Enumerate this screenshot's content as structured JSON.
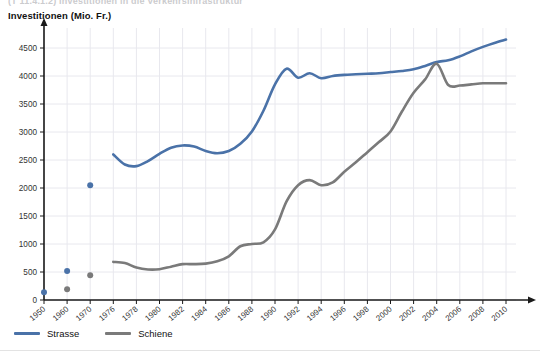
{
  "header": {
    "cut_title": "(T 11.4.1.2)   Investitionen in die Verkehrsinfrastruktur",
    "axis_title": "Investitionen (Mio. Fr.)"
  },
  "legend": {
    "position": "bottom-left",
    "items": [
      {
        "label": "Strasse",
        "color": "#4a72a8",
        "name": "legend-strasse"
      },
      {
        "label": "Schiene",
        "color": "#7a7a7a",
        "name": "legend-schiene"
      }
    ]
  },
  "colors": {
    "strasse": "#4a72a8",
    "schiene": "#7a7a7a",
    "grid": "#e8e8ee",
    "axis": "#1a1a1a",
    "text": "#333333"
  },
  "chart_data": {
    "type": "line",
    "title": "Investitionen in die Verkehrsinfrastruktur",
    "subtitle": "",
    "xlabel": "",
    "ylabel": "Investitionen (Mio. Fr.)",
    "ylim": [
      0,
      4750
    ],
    "yticks": [
      0,
      500,
      1000,
      1500,
      2000,
      2500,
      3000,
      3500,
      4000,
      4500
    ],
    "xticks": [
      "1950",
      "1960",
      "1970",
      "1976",
      "1978",
      "1980",
      "1982",
      "1984",
      "1986",
      "1988",
      "1990",
      "1992",
      "1994",
      "1996",
      "1998",
      "2000",
      "2002",
      "2004",
      "2006",
      "2008",
      "2010"
    ],
    "grid": true,
    "legend_position": "bottom-left",
    "series": [
      {
        "name": "Strasse",
        "color": "#4a72a8",
        "style": "line",
        "x": [
          1976,
          1977,
          1978,
          1979,
          1980,
          1981,
          1982,
          1983,
          1984,
          1985,
          1986,
          1987,
          1988,
          1989,
          1990,
          1991,
          1992,
          1993,
          1994,
          1995,
          1996,
          1997,
          1998,
          1999,
          2000,
          2001,
          2002,
          2003,
          2004,
          2005,
          2006,
          2007,
          2008,
          2009,
          2010
        ],
        "values": [
          2600,
          2420,
          2390,
          2480,
          2610,
          2720,
          2760,
          2740,
          2660,
          2620,
          2660,
          2790,
          3010,
          3380,
          3850,
          4130,
          3970,
          4050,
          3960,
          4000,
          4020,
          4030,
          4040,
          4050,
          4070,
          4090,
          4120,
          4180,
          4250,
          4280,
          4350,
          4440,
          4520,
          4590,
          4650
        ]
      },
      {
        "name": "Strasse (Einzelwerte)",
        "color": "#4a72a8",
        "style": "points",
        "x": [
          1950,
          1960,
          1970
        ],
        "values": [
          140,
          520,
          2050
        ]
      },
      {
        "name": "Schiene",
        "color": "#7a7a7a",
        "style": "line",
        "x": [
          1976,
          1977,
          1978,
          1979,
          1980,
          1981,
          1982,
          1983,
          1984,
          1985,
          1986,
          1987,
          1988,
          1989,
          1990,
          1991,
          1992,
          1993,
          1994,
          1995,
          1996,
          1997,
          1998,
          1999,
          2000,
          2001,
          2002,
          2003,
          2004,
          2005,
          2006,
          2007,
          2008,
          2009,
          2010
        ],
        "values": [
          680,
          660,
          580,
          545,
          550,
          595,
          640,
          640,
          650,
          690,
          780,
          960,
          1000,
          1030,
          1260,
          1760,
          2050,
          2140,
          2050,
          2100,
          2290,
          2460,
          2640,
          2820,
          3010,
          3370,
          3700,
          3940,
          4220,
          3840,
          3830,
          3850,
          3870,
          3870,
          3870
        ]
      },
      {
        "name": "Schiene (Einzelwerte)",
        "color": "#7a7a7a",
        "style": "points",
        "x": [
          1960,
          1970
        ],
        "values": [
          190,
          440
        ]
      }
    ]
  }
}
